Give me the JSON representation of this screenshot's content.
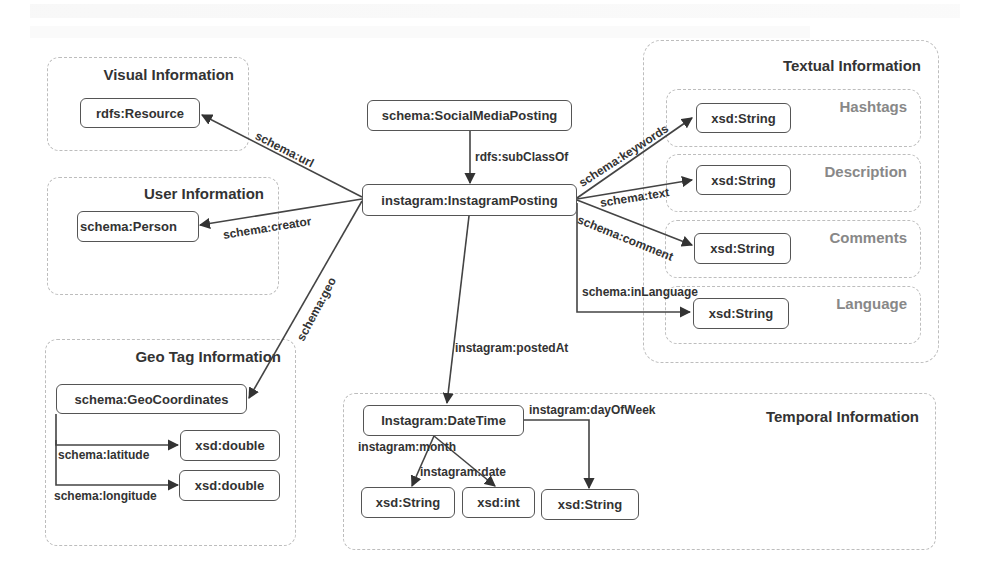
{
  "diagram": {
    "groups": {
      "visual": {
        "title": "Visual Information"
      },
      "user": {
        "title": "User Information"
      },
      "geo": {
        "title": "Geo Tag Information"
      },
      "textual": {
        "title": "Textual Information",
        "subgroups": [
          {
            "title": "Hashtags"
          },
          {
            "title": "Description"
          },
          {
            "title": "Comments"
          },
          {
            "title": "Language"
          }
        ]
      },
      "temporal": {
        "title": "Temporal Information"
      }
    },
    "nodes": {
      "social_media_posting": "schema:SocialMediaPosting",
      "instagram_posting": "instagram:InstagramPosting",
      "resource": "rdfs:Resource",
      "person": "schema:Person",
      "geo_coordinates": "schema:GeoCoordinates",
      "latitude_type": "xsd:double",
      "longitude_type": "xsd:double",
      "hashtags_type": "xsd:String",
      "description_type": "xsd:String",
      "comments_type": "xsd:String",
      "language_type": "xsd:String",
      "datetime": "Instagram:DateTime",
      "month_type": "xsd:String",
      "date_type": "xsd:int",
      "day_of_week_type": "xsd:String"
    },
    "edges": {
      "sub_class_of": "rdfs:subClassOf",
      "url": "schema:url",
      "creator": "schema:creator",
      "geo": "schema:geo",
      "keywords": "schema:keywords",
      "text": "schema:text",
      "comment": "schema:comment",
      "in_language": "schema:inLanguage",
      "posted_at": "instagram:postedAt",
      "latitude": "schema:latitude",
      "longitude": "schema:longitude",
      "month": "instagram:month",
      "date": "instagram:date",
      "day_of_week": "instagram:dayOfWeek"
    }
  }
}
